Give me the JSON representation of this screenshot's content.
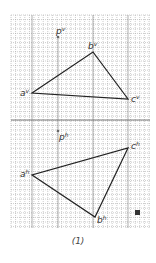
{
  "diagram": {
    "caption": "(1)",
    "grid": {
      "x0": 11,
      "y0": 15,
      "x1": 150,
      "y1": 228,
      "step": 4.6,
      "color": "#9a9a9a"
    },
    "axis_y": 120,
    "vertical_view": {
      "label": "p",
      "label_sup": "v",
      "points": {
        "a": {
          "label": "a",
          "sup": "v",
          "x": 32,
          "y": 93
        },
        "b": {
          "label": "b",
          "sup": "v",
          "x": 93,
          "y": 52
        },
        "c": {
          "label": "c",
          "sup": "v",
          "x": 128,
          "y": 99
        }
      },
      "p": {
        "x": 58,
        "y": 37
      }
    },
    "horizontal_view": {
      "label": "p",
      "label_sup": "h",
      "points": {
        "a": {
          "label": "a",
          "sup": "h",
          "x": 32,
          "y": 175
        },
        "b": {
          "label": "b",
          "sup": "h",
          "x": 95,
          "y": 217
        },
        "c": {
          "label": "c",
          "sup": "h",
          "x": 128,
          "y": 148
        }
      },
      "p": {
        "x": 58,
        "y": 134
      }
    },
    "marker_icon": "filled-square"
  }
}
